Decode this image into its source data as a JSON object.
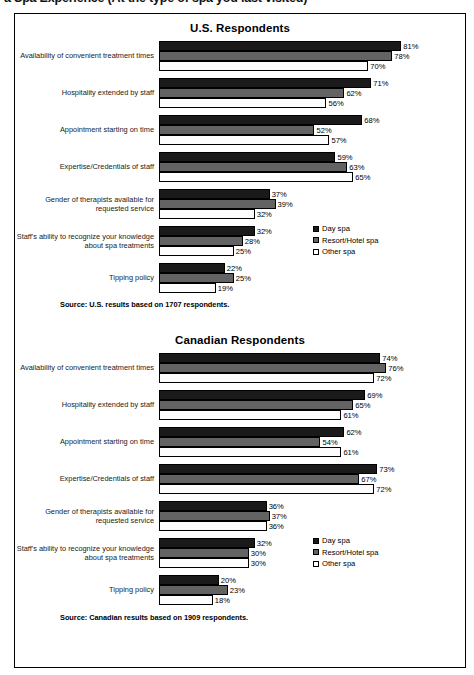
{
  "headline": "a Spa Experience (At the type of spa you last visited)",
  "legend": {
    "items": [
      {
        "label": "Day spa",
        "color": "#1a1a1a"
      },
      {
        "label": "Resort/Hotel spa",
        "color": "#636363"
      },
      {
        "label": "Other spa",
        "color": "#ffffff"
      }
    ]
  },
  "us": {
    "title": "U.S. Respondents",
    "source": "Source: U.S. results based on 1707 respondents."
  },
  "canada": {
    "title": "Canadian Respondents",
    "source": "Source: Canadian results based on 1909 respondents."
  },
  "chart_data": [
    {
      "type": "bar",
      "orientation": "horizontal",
      "title": "U.S. Respondents",
      "xlabel": "",
      "ylabel": "",
      "xlim": [
        0,
        100
      ],
      "grid": false,
      "legend_position": "middle-right",
      "value_suffix": "%",
      "categories": [
        "Availability of convenient treatment times",
        "Hospitality extended by staff",
        "Appointment starting on time",
        "Expertise/Credentials of staff",
        "Gender of therapists available for requested service",
        "Staff's ability to recognize your knowledge about spa treatments",
        "Tipping policy"
      ],
      "series": [
        {
          "name": "Day spa",
          "values": [
            81,
            71,
            68,
            59,
            37,
            32,
            22
          ]
        },
        {
          "name": "Resort/Hotel spa",
          "values": [
            78,
            62,
            52,
            63,
            39,
            28,
            25
          ]
        },
        {
          "name": "Other spa",
          "values": [
            70,
            56,
            57,
            65,
            32,
            25,
            19
          ]
        }
      ],
      "annotation": "Source: U.S. results based on 1707 respondents."
    },
    {
      "type": "bar",
      "orientation": "horizontal",
      "title": "Canadian Respondents",
      "xlabel": "",
      "ylabel": "",
      "xlim": [
        0,
        100
      ],
      "grid": false,
      "legend_position": "middle-right",
      "value_suffix": "%",
      "categories": [
        "Availability of convenient treatment times",
        "Hospitality extended by staff",
        "Appointment starting on time",
        "Expertise/Credentials of staff",
        "Gender of therapists available for requested service",
        "Staff's ability to recognize your knowledge about spa treatments",
        "Tipping policy"
      ],
      "series": [
        {
          "name": "Day spa",
          "values": [
            74,
            69,
            62,
            73,
            36,
            32,
            20
          ]
        },
        {
          "name": "Resort/Hotel spa",
          "values": [
            76,
            65,
            54,
            67,
            37,
            30,
            23
          ]
        },
        {
          "name": "Other spa",
          "values": [
            72,
            61,
            61,
            72,
            36,
            30,
            18
          ]
        }
      ],
      "annotation": "Source: Canadian results based on 1909 respondents."
    }
  ]
}
